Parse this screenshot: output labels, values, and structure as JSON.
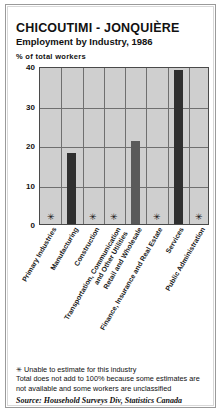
{
  "header": {
    "title": "CHICOUTIMI - JONQUIÈRE",
    "subtitle": "Employment by Industry, 1986",
    "axis_note": "% of total workers"
  },
  "footnotes": {
    "asterisk_glyph": "✳",
    "line1": "Unable to estimate for this industry",
    "line2": "Total does not add to 100% because some estimates are",
    "line3": "not available and some workers are unclassified",
    "source": "Source: Household Surveys Div, Statistics Canada"
  },
  "colors": {
    "bar_dark": "#2f2f2f",
    "bar_light": "#5a5a5a",
    "plot_background": "#cfcfcf",
    "gridline": "#6f6f6f",
    "frame": "#9a9a9a"
  },
  "chart_data": {
    "type": "bar",
    "title": "CHICOUTIMI - JONQUIÈRE",
    "subtitle": "Employment by Industry, 1986",
    "xlabel": "",
    "ylabel": "% of total workers",
    "ylim": [
      0,
      40
    ],
    "yticks": [
      0,
      10,
      20,
      30,
      40
    ],
    "grid": true,
    "legend": "none",
    "categories": [
      "Primary Industries",
      "Manufacturing",
      "Construction",
      "Transportation, Communication\nand Other Utilities",
      "Retail and Wholesale",
      "Finance, Insurance and Real Estate",
      "Services",
      "Public Administration"
    ],
    "category_lines": [
      [
        "Primary Industries"
      ],
      [
        "Manufacturing"
      ],
      [
        "Construction"
      ],
      [
        "Transportation, Communication",
        "and Other Utilities"
      ],
      [
        "Retail and Wholesale"
      ],
      [
        "Finance, Insurance and Real Estate"
      ],
      [
        "Services"
      ],
      [
        "Public Administration"
      ]
    ],
    "values": [
      null,
      18,
      null,
      null,
      21,
      null,
      39,
      null
    ],
    "unavailable_marker": "✳",
    "unavailable_categories": [
      "Primary Industries",
      "Construction",
      "Transportation, Communication and Other Utilities",
      "Finance, Insurance and Real Estate",
      "Public Administration"
    ],
    "annotations": [
      "✳ Unable to estimate for this industry",
      "Total does not add to 100% because some estimates are not available and some workers are unclassified"
    ]
  }
}
